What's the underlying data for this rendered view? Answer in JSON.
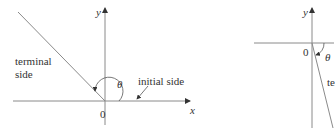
{
  "left_figure": {
    "y_axis_label": "y",
    "x_axis_label": "x",
    "origin_label": "0",
    "angle_label": "θ",
    "terminal_label_line1": "terminal",
    "terminal_label_line2": "side",
    "initial_label": "initial side"
  },
  "right_figure": {
    "y_axis_label": "y",
    "origin_label": "0",
    "angle_label": "θ",
    "terminal_label_partial": "te"
  },
  "colors": {
    "line": "#8a8a8a",
    "text": "#333333"
  }
}
